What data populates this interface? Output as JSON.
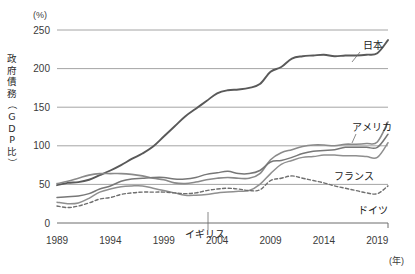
{
  "chart_data": {
    "type": "line",
    "title": "",
    "subtitle": "",
    "xlabel": "(年)",
    "ylabel": "政府債務（GDP比）",
    "yunit": "(%)",
    "ylim": [
      0,
      250
    ],
    "xlim": [
      1989,
      2020
    ],
    "yticks": [
      0,
      50,
      100,
      150,
      200,
      250
    ],
    "ytick_labels": [
      "0",
      "50",
      "100",
      "150",
      "200",
      "250"
    ],
    "xticks": [
      1989,
      1994,
      1999,
      2004,
      2009,
      2014,
      2019
    ],
    "xtick_labels": [
      "1989",
      "1994",
      "1999",
      "2004",
      "2009",
      "2014",
      "2019"
    ],
    "grid": "horizontal",
    "legend_position": "inline-right",
    "x": [
      1989,
      1990,
      1991,
      1992,
      1993,
      1994,
      1995,
      1996,
      1997,
      1998,
      1999,
      2000,
      2001,
      2002,
      2003,
      2004,
      2005,
      2006,
      2007,
      2008,
      2009,
      2010,
      2011,
      2012,
      2013,
      2014,
      2015,
      2016,
      2017,
      2018,
      2019,
      2020
    ],
    "series": [
      {
        "name": "日本",
        "label": "日本",
        "color": "#595959",
        "style": "solid",
        "width": 1.9,
        "label_x": 2019.2,
        "label_y": 218,
        "values": [
          49,
          52,
          53,
          56,
          62,
          68,
          75,
          83,
          90,
          99,
          112,
          125,
          138,
          148,
          158,
          168,
          172,
          173,
          175,
          180,
          196,
          202,
          213,
          216,
          217,
          218,
          216,
          217,
          217,
          218,
          220,
          237
        ]
      },
      {
        "name": "アメリカ",
        "label": "アメリカ",
        "color": "#8a8a8a",
        "style": "solid",
        "width": 1.6,
        "label_x": 2019.4,
        "label_y": 140,
        "values": [
          51,
          54,
          58,
          62,
          64,
          64,
          64,
          63,
          61,
          58,
          56,
          52,
          51,
          53,
          56,
          58,
          59,
          58,
          58,
          64,
          82,
          91,
          95,
          99,
          101,
          101,
          100,
          102,
          102,
          103,
          105,
          131
        ]
      },
      {
        "name": "フランス",
        "label": "フランス",
        "color": "#777777",
        "style": "solid",
        "width": 1.5,
        "label_x": 2018.0,
        "label_y": 73,
        "values": [
          33,
          34,
          35,
          38,
          44,
          48,
          54,
          57,
          58,
          59,
          59,
          57,
          57,
          59,
          63,
          65,
          67,
          64,
          64,
          68,
          79,
          81,
          85,
          90,
          93,
          94,
          95,
          98,
          98,
          98,
          98,
          115
        ]
      },
      {
        "name": "イギリス",
        "label": "イギリス",
        "color": "#8f8f8f",
        "style": "solid",
        "width": 1.5,
        "label_x": 2003.6,
        "label_y": -14,
        "leader_from_x": 2004.0,
        "leader_from_y": 40,
        "values": [
          27,
          25,
          26,
          32,
          40,
          44,
          47,
          48,
          48,
          45,
          42,
          39,
          36,
          36,
          37,
          39,
          40,
          41,
          42,
          50,
          64,
          76,
          81,
          85,
          86,
          88,
          88,
          87,
          87,
          86,
          85,
          104
        ]
      },
      {
        "name": "ドイツ",
        "label": "ドイツ",
        "color": "#6f6f6f",
        "style": "dashed",
        "width": 1.4,
        "label_x": 2019.3,
        "label_y": 29,
        "values": [
          22,
          20,
          22,
          26,
          31,
          33,
          37,
          39,
          40,
          40,
          40,
          39,
          38,
          39,
          42,
          44,
          45,
          44,
          42,
          43,
          55,
          58,
          61,
          58,
          55,
          52,
          48,
          45,
          42,
          39,
          38,
          48
        ]
      }
    ],
    "annotations": [
      {
        "text": "(%)",
        "x_px": 33,
        "y_px": 15,
        "kind": "y-unit"
      },
      {
        "text": "(年)",
        "x_px": 390,
        "y_px": 262,
        "kind": "x-unit"
      }
    ]
  }
}
